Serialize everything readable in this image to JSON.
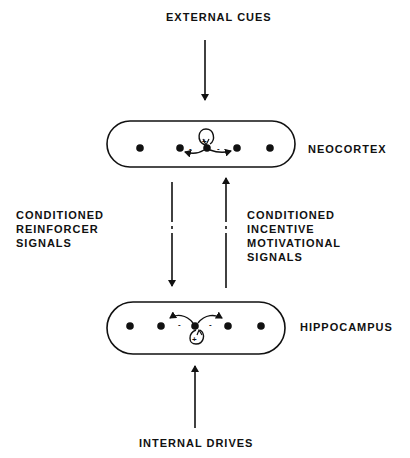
{
  "diagram": {
    "top_input": {
      "label": "EXTERNAL CUES"
    },
    "bottom_input": {
      "label": "INTERNAL DRIVES"
    },
    "regions": [
      {
        "name": "NEOCORTEX"
      },
      {
        "name": "HIPPOCAMPUS"
      }
    ],
    "left_signal": {
      "lines": [
        "CONDITIONED",
        "REINFORCER",
        "SIGNALS"
      ]
    },
    "right_signal": {
      "lines": [
        "CONDITIONED",
        "INCENTIVE",
        "MOTIVATIONAL",
        "SIGNALS"
      ]
    },
    "neocortex_signs": {
      "self": "+",
      "left": "-",
      "right": "-"
    },
    "hippocampus_signs": {
      "self": "+",
      "left": "-",
      "right": "-"
    }
  }
}
